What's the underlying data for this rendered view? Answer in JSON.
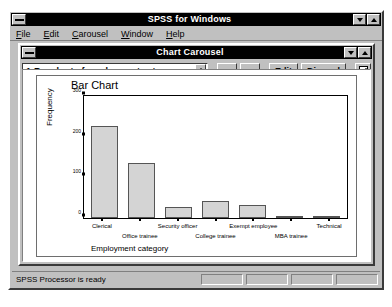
{
  "app": {
    "title": "SPSS for Windows",
    "sysmenu_icon": "system-menu-icon",
    "minimize_icon": "minimize-icon",
    "maximize_icon": "maximize-icon"
  },
  "menubar": {
    "items": [
      {
        "label": "File",
        "accel": "F"
      },
      {
        "label": "Edit",
        "accel": "E"
      },
      {
        "label": "Carousel",
        "accel": "C"
      },
      {
        "label": "Window",
        "accel": "W"
      },
      {
        "label": "Help",
        "accel": "H"
      }
    ]
  },
  "child_window": {
    "title": "Chart Carousel",
    "sysmenu_icon": "system-menu-icon",
    "minimize_icon": "minimize-icon",
    "maximize_icon": "maximize-icon"
  },
  "toolbar": {
    "chart_selector_value": "1:Bar chart of employment category",
    "spinner_icon": "spinner-updown-icon",
    "prev_icon": "arrow-up-icon",
    "next_icon": "arrow-down-icon",
    "edit_label": "Edit",
    "discard_label": "Discard",
    "copy_icon": "copy-chart-icon"
  },
  "statusbar": {
    "message": "SPSS Processor is ready"
  },
  "chart_data": {
    "type": "bar",
    "title": "Bar Chart",
    "xlabel": "Employment category",
    "ylabel": "Frequency",
    "categories": [
      "Clerical",
      "Office trainee",
      "Security officer",
      "College trainee",
      "Exempt employee",
      "MBA trainee",
      "Technical"
    ],
    "values": [
      227,
      136,
      27,
      41,
      32,
      5,
      6
    ],
    "ylim": [
      0,
      300
    ],
    "yticks": [
      0,
      100,
      200,
      300
    ],
    "ytick_labels": [
      "0",
      "100",
      "200",
      "300"
    ],
    "grid": false,
    "legend": "none",
    "bar_fill": "#d4d4d4",
    "bar_border": "#555555"
  }
}
